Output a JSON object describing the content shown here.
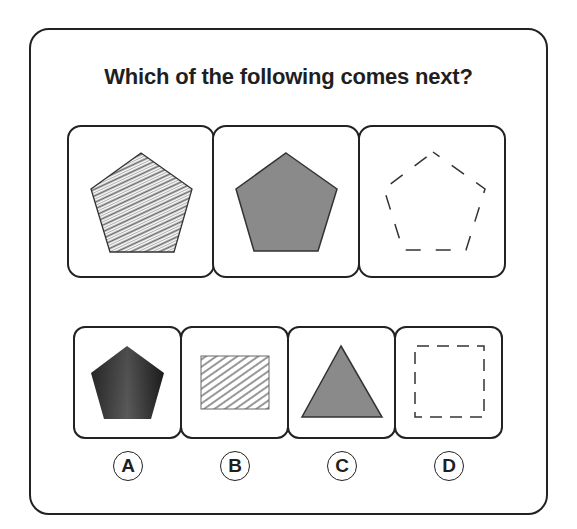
{
  "question": {
    "title": "Which of the following comes next?"
  },
  "sequence": [
    {
      "index": 1,
      "shape": "pentagon",
      "fill": "hatched",
      "stroke": "solid"
    },
    {
      "index": 2,
      "shape": "pentagon",
      "fill": "solid-gray",
      "stroke": "solid"
    },
    {
      "index": 3,
      "shape": "pentagon",
      "fill": "none",
      "stroke": "dashed"
    }
  ],
  "options": [
    {
      "label": "A",
      "shape": "pentagon",
      "fill": "dark-gradient",
      "stroke": "none"
    },
    {
      "label": "B",
      "shape": "rectangle",
      "fill": "hatched",
      "stroke": "solid"
    },
    {
      "label": "C",
      "shape": "triangle",
      "fill": "solid-gray",
      "stroke": "solid"
    },
    {
      "label": "D",
      "shape": "square",
      "fill": "none",
      "stroke": "dashed"
    }
  ],
  "colors": {
    "border": "#222222",
    "gray_fill": "#8a8a8a",
    "hatch": "#6a6a6a",
    "text": "#1f1f1f"
  }
}
